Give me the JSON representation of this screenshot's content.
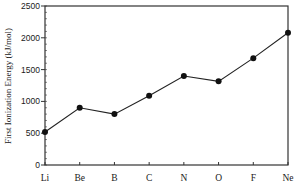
{
  "chart_data": {
    "type": "line",
    "title": "",
    "xlabel": "",
    "ylabel": "First Ionization Energy (kJ/mol)",
    "categories": [
      "Li",
      "Be",
      "B",
      "C",
      "N",
      "O",
      "F",
      "Ne"
    ],
    "series": [
      {
        "name": "First Ionization Energy",
        "values": [
          520,
          900,
          800,
          1090,
          1400,
          1315,
          1680,
          2080
        ]
      }
    ],
    "ylim": [
      0,
      2500
    ],
    "yticks": [
      0,
      500,
      1000,
      1500,
      2000,
      2500
    ],
    "minor_ytick_step": 100,
    "grid": false,
    "legend": null,
    "colors": {
      "line": "#222222",
      "marker": "#111111",
      "axis": "#333333"
    }
  }
}
